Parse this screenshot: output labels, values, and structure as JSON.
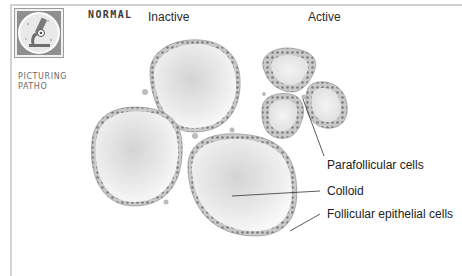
{
  "header": {
    "section_title": "NORMAL",
    "badge": {
      "icon": "microscope-icon",
      "caption_line1": "PICTURING",
      "caption_line2": "PATHO"
    }
  },
  "diagram": {
    "groups": [
      {
        "label": "Inactive",
        "follicle_count": 3
      },
      {
        "label": "Active",
        "follicle_count": 3
      }
    ],
    "callouts": [
      {
        "label": "Parafollicular cells"
      },
      {
        "label": "Colloid"
      },
      {
        "label": "Follicular epithelial cells"
      }
    ],
    "colors": {
      "frame": "#d0d0d0",
      "epithelium": "#9a9a9a",
      "colloid_center": "#d6d6d6",
      "colloid_edge": "#f6f6f6",
      "leader_line": "#333333",
      "badge_bg": "#8c8c8c"
    }
  }
}
